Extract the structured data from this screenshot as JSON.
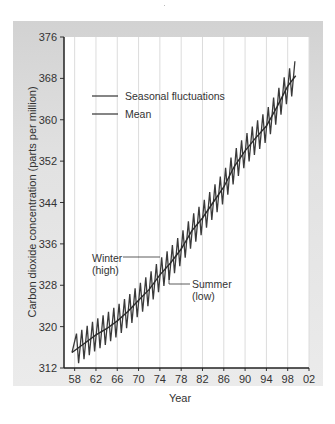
{
  "chart_data": {
    "type": "line",
    "title": "",
    "xlabel": "Year",
    "ylabel": "Carbon dioxide concentration (parts per million)",
    "xlim": [
      1956,
      2002
    ],
    "ylim": [
      312,
      376
    ],
    "x_ticks": [
      "58",
      "62",
      "66",
      "70",
      "74",
      "78",
      "82",
      "86",
      "90",
      "94",
      "98",
      "02"
    ],
    "y_ticks": [
      "312",
      "320",
      "328",
      "336",
      "344",
      "352",
      "360",
      "368",
      "376"
    ],
    "grid": "vertical",
    "legend": {
      "position": "upper-left",
      "entries": [
        "Seasonal fluctuations",
        "Mean"
      ]
    },
    "annotations": [
      {
        "text": "Winter (high)",
        "line1": "Winter",
        "line2": "(high)",
        "x": 1975,
        "y": 333.5
      },
      {
        "text": "Summer (low)",
        "line1": "Summer",
        "line2": "(low)",
        "x": 1976,
        "y": 326.5
      }
    ],
    "series": [
      {
        "name": "Mean",
        "x": [
          1957.5,
          1960,
          1962,
          1964,
          1966,
          1968,
          1970,
          1972,
          1974,
          1976,
          1978,
          1980,
          1982,
          1984,
          1986,
          1988,
          1990,
          1992,
          1994,
          1996,
          1998,
          1999.5
        ],
        "values": [
          315.0,
          316.9,
          318.4,
          319.6,
          321.1,
          322.9,
          325.1,
          327.2,
          330.0,
          332.3,
          335.0,
          338.5,
          341.0,
          344.0,
          347.0,
          351.0,
          354.0,
          356.5,
          358.8,
          362.5,
          366.5,
          368.5
        ]
      },
      {
        "name": "Seasonal fluctuations",
        "description": "Annual sawtooth around the mean, amplitude approx. ±3 ppm (winter high, summer low)",
        "amplitude": 3.0,
        "x_range": [
          1957.5,
          1999.5
        ]
      }
    ]
  },
  "legend": {
    "seasonal": "Seasonal fluctuations",
    "mean": "Mean"
  },
  "annotations": {
    "winter1": "Winter",
    "winter2": "(high)",
    "summer1": "Summer",
    "summer2": "(low)"
  },
  "axes": {
    "xlabel": "Year",
    "ylabel": "Carbon dioxide concentration (parts per million)",
    "x_ticks": [
      "58",
      "62",
      "66",
      "70",
      "74",
      "78",
      "82",
      "86",
      "90",
      "94",
      "98",
      "02"
    ],
    "y_ticks": [
      "312",
      "320",
      "328",
      "336",
      "344",
      "352",
      "360",
      "368",
      "376"
    ]
  }
}
